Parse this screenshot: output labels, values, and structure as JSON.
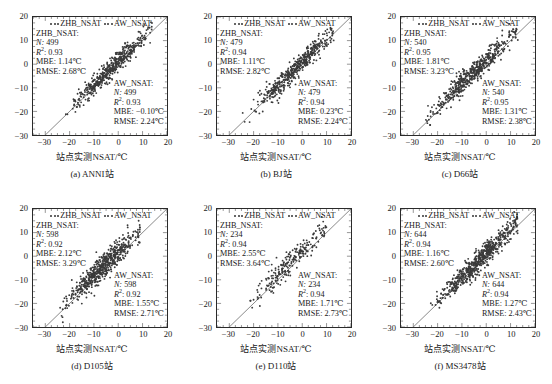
{
  "figure": {
    "axis_x_title": "站点实测NSAT/℃",
    "legend": [
      {
        "name": "ZHB_NSAT",
        "marker": "dots"
      },
      {
        "name": "AW_NSAT",
        "marker": "dots"
      }
    ],
    "series_colors": {
      "zhb": "#3a3a3a",
      "aw": "#3a3a3a",
      "one_to_one_line": "#555555"
    },
    "axis": {
      "xticks": [
        -30,
        -20,
        -10,
        0,
        10,
        20
      ],
      "yticks": [
        20,
        10,
        0,
        -10,
        -20,
        -30
      ],
      "xlim": [
        -35,
        20
      ],
      "ylim": [
        -30,
        20
      ],
      "grid": false
    },
    "labels": {
      "n": "N:",
      "r2": "R",
      "r2_sup": "2",
      "r2_colon": ":",
      "mbe": "MBE:",
      "rmse": "RMSE:",
      "zhb_title": "ZHB_NSAT:",
      "aw_title": "AW_NSAT:"
    }
  },
  "chart_data": {
    "type": "scatter",
    "title": "",
    "xlabel": "站点实测NSAT/℃",
    "ylabel": "",
    "xlim": [
      -35,
      20
    ],
    "ylim": [
      -30,
      20
    ],
    "xticks": [
      -30,
      -20,
      -10,
      0,
      10,
      20
    ],
    "yticks": [
      -30,
      -20,
      -10,
      0,
      10,
      20
    ],
    "grid": false,
    "legend": [
      "ZHB_NSAT",
      "AW_NSAT"
    ],
    "legend_position": "top-inside",
    "reference_line": "1:1 identity line",
    "panels": [
      {
        "id": "a",
        "caption": "(a) ANNI站",
        "station": "ANNI站",
        "zhb": {
          "label": "ZHB_NSAT:",
          "N": "499",
          "R2": "0.93",
          "MBE": "1.14℃",
          "RMSE": "2.68℃"
        },
        "aw": {
          "label": "AW_NSAT:",
          "N": "499",
          "R2": "0.93",
          "MBE": "-0.10℃",
          "RMSE": "2.24℃"
        },
        "cloud": {
          "n_points": 499,
          "x_mean": -3.0,
          "x_sd": 7.4,
          "slope": 1.0,
          "intercept": 1.0,
          "noise": 2.1,
          "x_min": -22,
          "x_max": 14
        }
      },
      {
        "id": "b",
        "caption": "(b) BJ站",
        "station": "BJ站",
        "zhb": {
          "label": "ZHB_NSAT:",
          "N": "479",
          "R2": "0.94",
          "MBE": "1.11℃",
          "RMSE": "2.82℃"
        },
        "aw": {
          "label": "AW_NSAT:",
          "N": "479",
          "R2": "0.94",
          "MBE": "0.23℃",
          "RMSE": "2.24℃"
        },
        "cloud": {
          "n_points": 479,
          "x_mean": -3.5,
          "x_sd": 7.8,
          "slope": 1.0,
          "intercept": 1.0,
          "noise": 2.2,
          "x_min": -25,
          "x_max": 13
        }
      },
      {
        "id": "c",
        "caption": "(c) D66站",
        "station": "D66站",
        "zhb": {
          "label": "ZHB_NSAT:",
          "N": "540",
          "R2": "0.95",
          "MBE": "1.81℃",
          "RMSE": "3.23℃"
        },
        "aw": {
          "label": "AW_NSAT:",
          "N": "540",
          "R2": "0.95",
          "MBE": "1.31℃",
          "RMSE": "2.38℃"
        },
        "cloud": {
          "n_points": 540,
          "x_mean": -5.0,
          "x_sd": 8.6,
          "slope": 1.0,
          "intercept": 1.6,
          "noise": 2.3,
          "x_min": -26,
          "x_max": 13
        }
      },
      {
        "id": "d",
        "caption": "(d) D105站",
        "station": "D105站",
        "zhb": {
          "label": "ZHB_NSAT:",
          "N": "598",
          "R2": "0.92",
          "MBE": "2.12℃",
          "RMSE": "3.29℃"
        },
        "aw": {
          "label": "AW_NSAT:",
          "N": "598",
          "R2": "0.92",
          "MBE": "1.55℃",
          "RMSE": "2.71℃"
        },
        "cloud": {
          "n_points": 598,
          "x_mean": -6.0,
          "x_sd": 7.6,
          "slope": 1.0,
          "intercept": 1.9,
          "noise": 2.5,
          "x_min": -24,
          "x_max": 9
        }
      },
      {
        "id": "e",
        "caption": "(e) D110站",
        "station": "D110站",
        "zhb": {
          "label": "ZHB_NSAT:",
          "N": "234",
          "R2": "0.94",
          "MBE": "2.55℃",
          "RMSE": "3.64℃"
        },
        "aw": {
          "label": "AW_NSAT:",
          "N": "234",
          "R2": "0.94",
          "MBE": "1.71℃",
          "RMSE": "2.73℃"
        },
        "cloud": {
          "n_points": 234,
          "x_mean": -5.5,
          "x_sd": 7.9,
          "slope": 1.0,
          "intercept": 2.2,
          "noise": 2.6,
          "x_min": -22,
          "x_max": 10
        }
      },
      {
        "id": "f",
        "caption": "(f) MS3478站",
        "station": "MS3478站",
        "zhb": {
          "label": "ZHB_NSAT:",
          "N": "644",
          "R2": "0.94",
          "MBE": "1.16℃",
          "RMSE": "2.60℃"
        },
        "aw": {
          "label": "AW_NSAT:",
          "N": "644",
          "R2": "0.94",
          "MBE": "1.27℃",
          "RMSE": "2.43℃"
        },
        "cloud": {
          "n_points": 644,
          "x_mean": -3.2,
          "x_sd": 8.0,
          "slope": 1.0,
          "intercept": 1.2,
          "noise": 2.2,
          "x_min": -23,
          "x_max": 13
        }
      }
    ]
  }
}
